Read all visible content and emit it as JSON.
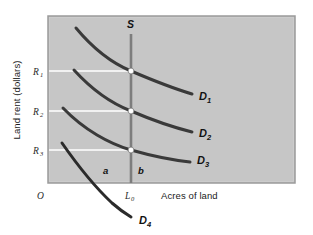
{
  "chart_data": {
    "type": "line",
    "title": "",
    "xlabel": "Acres of land",
    "ylabel": "Land rent (dollars)",
    "origin_label": "O",
    "grid": false,
    "legend_position": "inline-right",
    "background_color": "#c6c6c6",
    "curve_color": "#3a3a3a",
    "guide_line_color": "#ffffff",
    "marker_color": "#ffffff",
    "x_ticks": [
      {
        "label": "L",
        "sub": "0",
        "value": 131
      }
    ],
    "y_ticks": [
      {
        "label": "R",
        "sub": "1",
        "value": 71
      },
      {
        "label": "R",
        "sub": "2",
        "value": 111
      },
      {
        "label": "R",
        "sub": "3",
        "value": 150
      }
    ],
    "series": [
      {
        "name": "S",
        "kind": "supply-vertical",
        "label": "S",
        "label_sub": "",
        "path": "M 131 34 L 131 183"
      },
      {
        "name": "D1",
        "kind": "demand",
        "label": "D",
        "label_sub": "1",
        "path": "M 76 28 C 96 52, 114 64, 131 71 C 152 80, 172 88, 192 94"
      },
      {
        "name": "D2",
        "kind": "demand",
        "label": "D",
        "label_sub": "2",
        "path": "M 74 70 C 94 92, 113 104, 131 111 C 152 120, 172 127, 192 132"
      },
      {
        "name": "D3",
        "kind": "demand",
        "label": "D",
        "label_sub": "3",
        "path": "M 63 108 C 84 130, 110 144, 131 150 C 152 156, 172 160, 190 162"
      },
      {
        "name": "D4",
        "kind": "demand-below",
        "label": "D",
        "label_sub": "4",
        "path": "M 62 143 C 78 166, 96 188, 112 203 C 120 210, 126 214, 131 217"
      }
    ],
    "equilibrium_points": [
      {
        "name": "E1",
        "x": 131,
        "y": 71
      },
      {
        "name": "E2",
        "x": 131,
        "y": 111
      },
      {
        "name": "E3",
        "x": 131,
        "y": 150
      }
    ],
    "area_labels": [
      {
        "name": "a",
        "text": "a",
        "x": 103,
        "y": 174
      },
      {
        "name": "b",
        "text": "b",
        "x": 138,
        "y": 174
      }
    ],
    "curve_label_positions": [
      {
        "name": "D1",
        "x": 199,
        "y": 100
      },
      {
        "name": "D2",
        "x": 199,
        "y": 137
      },
      {
        "name": "D3",
        "x": 197,
        "y": 164
      },
      {
        "name": "D4",
        "x": 139,
        "y": 224
      }
    ],
    "supply_label_position": {
      "x": 127,
      "y": 28
    },
    "plot_area": {
      "x": 48,
      "y": 16,
      "width": 247,
      "height": 167
    },
    "axis_label_positions": {
      "ylabel": {
        "x": 20,
        "y": 100
      },
      "xlabel": {
        "x": 161,
        "y": 197
      },
      "origin": {
        "x": 40,
        "y": 197
      },
      "xtick": {
        "x": 126,
        "y": 198
      }
    }
  }
}
